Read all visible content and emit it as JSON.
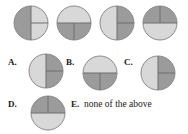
{
  "page": {
    "background_color": "#ffffff",
    "kind": "multiple-choice-figure-question"
  },
  "palette": {
    "shaded": "#9b9b9b",
    "unshaded": "#d8d8d8",
    "outline": "#8a8a8a",
    "divider": "#6f6f6f",
    "text": "#1a1a1a"
  },
  "prompt_row": {
    "name": "reference-circles",
    "circles": [
      {
        "id": "ref-1",
        "description": "circle split into left half and two right quarters; left half shaded, right quarters unshaded",
        "shaded_fraction": "1/2",
        "parts": [
          {
            "part": "left-half",
            "shaded": true
          },
          {
            "part": "right-top-quarter",
            "shaded": false
          },
          {
            "part": "right-bottom-quarter",
            "shaded": false
          }
        ],
        "dividers": [
          "vertical-full",
          "horizontal-right"
        ]
      },
      {
        "id": "ref-2",
        "description": "circle with unshaded top half and two shaded bottom quarters",
        "shaded_fraction": "1/2",
        "parts": [
          {
            "part": "top-half",
            "shaded": false
          },
          {
            "part": "bottom-left-quarter",
            "shaded": true
          },
          {
            "part": "bottom-right-quarter",
            "shaded": true
          }
        ],
        "dividers": [
          "horizontal-full",
          "vertical-bottom"
        ]
      },
      {
        "id": "ref-3",
        "description": "circle with unshaded left half and two shaded right quarters",
        "shaded_fraction": "1/2",
        "parts": [
          {
            "part": "left-half",
            "shaded": false
          },
          {
            "part": "right-top-quarter",
            "shaded": true
          },
          {
            "part": "right-bottom-quarter",
            "shaded": true
          }
        ],
        "dividers": [
          "vertical-full",
          "horizontal-right"
        ]
      },
      {
        "id": "ref-4",
        "description": "circle with two shaded top quarters and unshaded bottom half",
        "shaded_fraction": "1/2",
        "parts": [
          {
            "part": "top-left-quarter",
            "shaded": true
          },
          {
            "part": "top-right-quarter",
            "shaded": true
          },
          {
            "part": "bottom-half",
            "shaded": false
          }
        ],
        "dividers": [
          "horizontal-full",
          "vertical-top"
        ]
      }
    ]
  },
  "choices": [
    {
      "id": "choice-a",
      "label": "A.",
      "has_figure": true,
      "text": "",
      "circle": {
        "description": "circle with unshaded left half and two shaded right quarters",
        "shaded_fraction": "1/2",
        "parts": [
          {
            "part": "left-half",
            "shaded": false
          },
          {
            "part": "right-top-quarter",
            "shaded": true
          },
          {
            "part": "right-bottom-quarter",
            "shaded": true
          }
        ],
        "dividers": [
          "vertical-full",
          "horizontal-right"
        ]
      }
    },
    {
      "id": "choice-b",
      "label": "B.",
      "has_figure": true,
      "text": "",
      "circle": {
        "description": "circle with unshaded top half and two shaded bottom quarters",
        "shaded_fraction": "1/2",
        "parts": [
          {
            "part": "top-half",
            "shaded": false
          },
          {
            "part": "bottom-left-quarter",
            "shaded": true
          },
          {
            "part": "bottom-right-quarter",
            "shaded": true
          }
        ],
        "dividers": [
          "horizontal-full",
          "vertical-bottom"
        ]
      }
    },
    {
      "id": "choice-c",
      "label": "C.",
      "has_figure": true,
      "text": "",
      "circle": {
        "description": "circle with unshaded left half and two shaded right quarters",
        "shaded_fraction": "1/2",
        "parts": [
          {
            "part": "left-half",
            "shaded": false
          },
          {
            "part": "right-top-quarter",
            "shaded": true
          },
          {
            "part": "right-bottom-quarter",
            "shaded": true
          }
        ],
        "dividers": [
          "vertical-full",
          "horizontal-right"
        ]
      }
    },
    {
      "id": "choice-d",
      "label": "D.",
      "has_figure": true,
      "text": "",
      "circle": {
        "description": "circle with two shaded top quarters and unshaded bottom half",
        "shaded_fraction": "1/2",
        "parts": [
          {
            "part": "top-left-quarter",
            "shaded": true
          },
          {
            "part": "top-right-quarter",
            "shaded": true
          },
          {
            "part": "bottom-half",
            "shaded": false
          }
        ],
        "dividers": [
          "horizontal-full",
          "vertical-top"
        ]
      }
    },
    {
      "id": "choice-e",
      "label": "E.",
      "has_figure": false,
      "text": "none of the above",
      "circle": null
    }
  ]
}
